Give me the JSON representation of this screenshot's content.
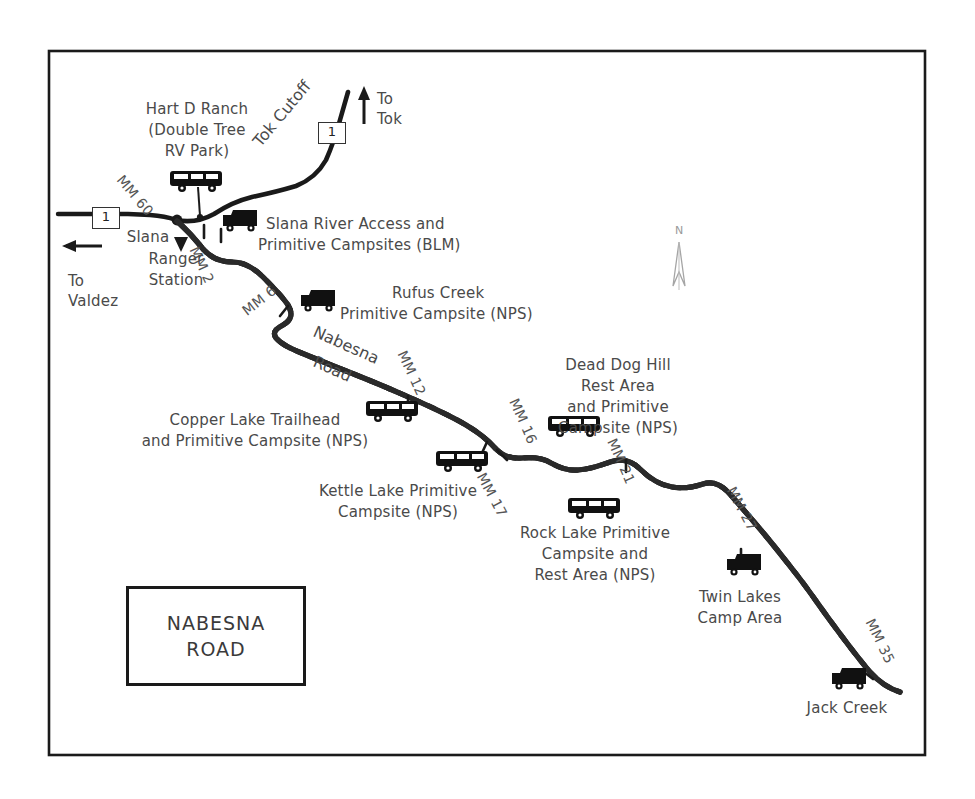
{
  "map": {
    "title_lines": [
      "NABESNA",
      "ROAD"
    ],
    "north_label": "N",
    "border_color": "#1a1a1a",
    "road_color": "#1a1a1a",
    "gravel_fill": "#b9b9b9",
    "text_color": "#4a4a4a"
  },
  "highways": {
    "shield_1_west": "1",
    "shield_1_north": "1",
    "tok_cutoff_label": "Tok Cutoff",
    "nabesna_road_line1": "Nabesna",
    "nabesna_road_line2": "Road"
  },
  "directions": {
    "to_tok_line1": "To",
    "to_tok_line2": "Tok",
    "to_valdez_line1": "To",
    "to_valdez_line2": "Valdez"
  },
  "places": {
    "hart_d_ranch": [
      "Hart D Ranch",
      "(Double Tree",
      "RV Park)"
    ],
    "slana_ranger_station": [
      "Slana",
      "Ranger",
      "Station"
    ],
    "slana_river_access": [
      "Slana River Access and",
      "Primitive Campsites (BLM)"
    ],
    "rufus_creek": [
      "Rufus Creek",
      "Primitive Campsite (NPS)"
    ],
    "copper_lake": [
      "Copper Lake Trailhead",
      "and Primitive Campsite (NPS)"
    ],
    "kettle_lake": [
      "Kettle Lake Primitive",
      "Campsite (NPS)"
    ],
    "dead_dog_hill": [
      "Dead Dog Hill",
      "Rest Area",
      "and Primitive",
      "Campsite (NPS)"
    ],
    "rock_lake": [
      "Rock Lake Primitive",
      "Campsite and",
      "Rest Area (NPS)"
    ],
    "twin_lakes": [
      "Twin Lakes",
      "Camp Area"
    ],
    "jack_creek": [
      "Jack Creek"
    ]
  },
  "mileposts": [
    {
      "id": "mm60",
      "label": "MM 60"
    },
    {
      "id": "mm2",
      "label": "MM 2"
    },
    {
      "id": "mm6",
      "label": "MM 6"
    },
    {
      "id": "mm12",
      "label": "MM 12"
    },
    {
      "id": "mm16",
      "label": "MM 16"
    },
    {
      "id": "mm17",
      "label": "MM 17"
    },
    {
      "id": "mm21",
      "label": "MM 21"
    },
    {
      "id": "mm27",
      "label": "MM 27"
    },
    {
      "id": "mm35",
      "label": "MM 35"
    }
  ]
}
